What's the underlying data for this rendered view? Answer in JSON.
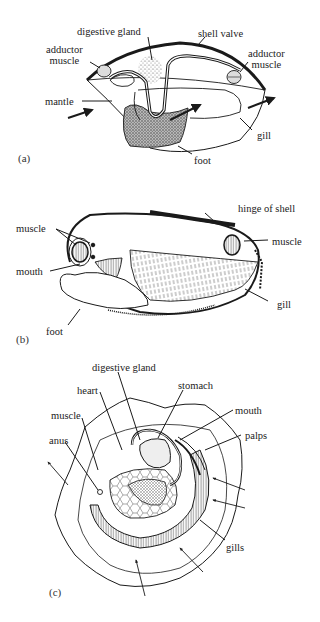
{
  "figure": {
    "panels": [
      {
        "id": "a",
        "label": "(a)",
        "labels": {
          "digestive_gland": "digestive gland",
          "shell_valve": "shell valve",
          "adductor_muscle_left": "adductor\nmuscle",
          "adductor_muscle_right": "adductor\nmuscle",
          "mantle": "mantle",
          "gill": "gill",
          "foot": "foot"
        }
      },
      {
        "id": "b",
        "label": "(b)",
        "labels": {
          "hinge_of_shell": "hinge of shell",
          "muscle_left": "muscle",
          "muscle_right": "muscle",
          "mouth": "mouth",
          "gill": "gill",
          "foot": "foot"
        }
      },
      {
        "id": "c",
        "label": "(c)",
        "labels": {
          "digestive_gland": "digestive gland",
          "stomach": "stomach",
          "heart": "heart",
          "muscle": "muscle",
          "mouth": "mouth",
          "anus": "anus",
          "palps": "palps",
          "gills": "gills"
        }
      }
    ],
    "colors": {
      "ink": "#1a1a1a",
      "stipple": "#888888",
      "background": "#ffffff"
    }
  }
}
